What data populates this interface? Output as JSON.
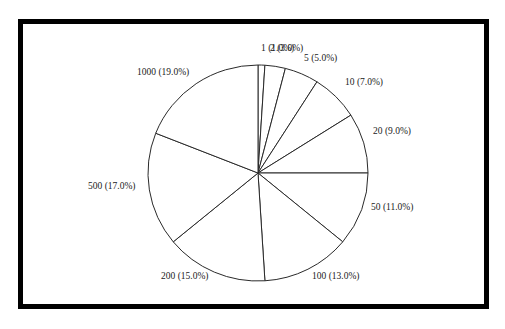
{
  "chart_data": {
    "type": "pie",
    "title": "",
    "start_angle_deg": 0,
    "direction": "clockwise",
    "categories": [
      "1",
      "2",
      "5",
      "10",
      "20",
      "50",
      "100",
      "200",
      "500",
      "1000"
    ],
    "values": [
      1.0,
      3.0,
      5.0,
      7.0,
      9.0,
      11.0,
      13.0,
      15.0,
      17.0,
      19.0
    ],
    "labels": [
      "1 (1.0%)",
      "2 (3.0%)",
      "5 (5.0%)",
      "10 (7.0%)",
      "20 (9.0%)",
      "50 (11.0%)",
      "100 (13.0%)",
      "200 (15.0%)",
      "500 (17.0%)",
      "1000 (19.0%)"
    ],
    "legend": "none",
    "fill_color": "#ffffff",
    "stroke_color": "#2a2a2a",
    "frame_color": "#000000"
  },
  "label_positions": [
    {
      "x": 261,
      "y": 51
    },
    {
      "x": 270,
      "y": 51
    },
    {
      "x": 304,
      "y": 61
    },
    {
      "x": 345,
      "y": 85
    },
    {
      "x": 373,
      "y": 134
    },
    {
      "x": 371,
      "y": 210
    },
    {
      "x": 312,
      "y": 279
    },
    {
      "x": 161,
      "y": 279
    },
    {
      "x": 88,
      "y": 189
    },
    {
      "x": 137,
      "y": 75
    }
  ]
}
